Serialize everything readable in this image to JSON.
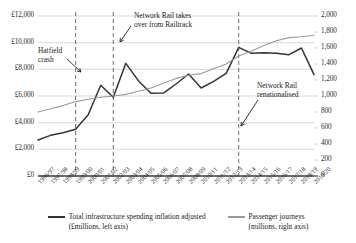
{
  "chart_data": {
    "type": "line",
    "title": "",
    "xlabel": "",
    "grid": true,
    "legend_position": "bottom",
    "categories": [
      "1996/97",
      "1997/98",
      "1998/99",
      "1999/00",
      "2000/01",
      "2001/02",
      "2002/03",
      "2003/04",
      "2004/05",
      "2005/06",
      "2006/07",
      "2007/08",
      "2008/09",
      "2010/11",
      "2011/12",
      "2012/13",
      "2013/14",
      "2014/15",
      "2015/16",
      "2016/17",
      "2017/18",
      "2018/19",
      "2019/20"
    ],
    "left_axis": {
      "label": "£millions",
      "ylim": [
        0,
        12000
      ],
      "ticks": [
        "£0",
        "£2,000",
        "£4,000",
        "£6,000",
        "£8,000",
        "£10,000",
        "£12,000"
      ],
      "tick_values": [
        0,
        2000,
        4000,
        6000,
        8000,
        10000,
        12000
      ]
    },
    "right_axis": {
      "label": "millions",
      "ylim": [
        0,
        2000
      ],
      "ticks": [
        "0",
        "200",
        "400",
        "600",
        "800",
        "1,000",
        "1,200",
        "1,400",
        "1,600",
        "1,800",
        "2,000"
      ],
      "tick_values": [
        0,
        200,
        400,
        600,
        800,
        1000,
        1200,
        1400,
        1600,
        1800,
        2000
      ]
    },
    "series": [
      {
        "name": "Total infrastructure spending inflation adjusted",
        "axis": "left",
        "color": "#333333",
        "values": [
          2700,
          3050,
          3250,
          3500,
          4600,
          6800,
          5900,
          8450,
          7150,
          6200,
          6220,
          6900,
          7650,
          6600,
          7100,
          7700,
          9650,
          9200,
          9250,
          9200,
          9100,
          9600,
          7600
        ]
      },
      {
        "name": "Passenger journeys",
        "axis": "right",
        "color": "#9a9a9a",
        "values": [
          800,
          840,
          880,
          930,
          960,
          985,
          1000,
          1020,
          1060,
          1100,
          1160,
          1220,
          1260,
          1280,
          1340,
          1400,
          1500,
          1560,
          1630,
          1690,
          1730,
          1740,
          1760
        ]
      }
    ],
    "annotations": [
      {
        "id": "hatfield",
        "text_lines": [
          "Hatfield",
          "crash"
        ],
        "target_category": "1999/00"
      },
      {
        "id": "network-rail-takeover",
        "text_lines": [
          "Network Rail takes",
          "over from Railtrack"
        ],
        "target_category": "2002/03"
      },
      {
        "id": "renationalised",
        "text_lines": [
          "Network Rail",
          "renationalised"
        ],
        "target_category": "2013/14"
      }
    ],
    "vertical_markers": [
      "1999/00",
      "2002/03",
      "2013/14"
    ]
  },
  "legend": {
    "items": [
      {
        "line1": "Total infrastructure spending inflation adjusted",
        "line2": "(£millions, left axis)",
        "color": "#333333"
      },
      {
        "line1": "Passenger journeys",
        "line2": "(millions, right axis)",
        "color": "#9a9a9a"
      }
    ]
  }
}
